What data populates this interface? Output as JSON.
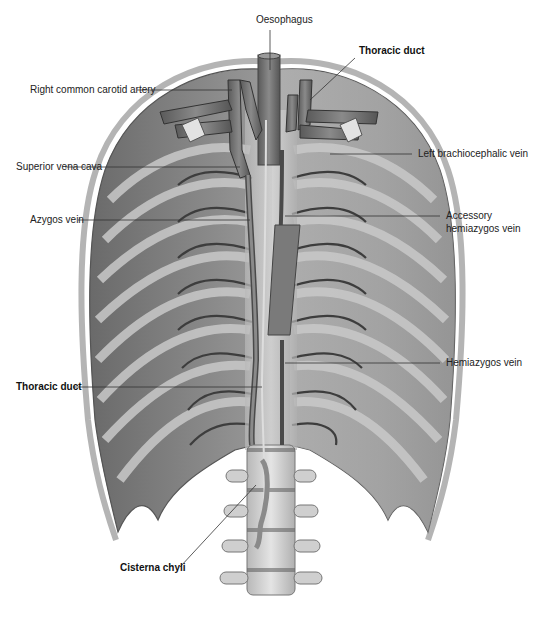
{
  "figure": {
    "style": "grayscale anatomical illustration",
    "colors": {
      "background": "#ffffff",
      "muscle": "#8c8c8c",
      "rib": "#bdbdbd",
      "vessel": "#6e6e6e",
      "vertebra": "#d6d6d6",
      "label_text": "#222222"
    }
  },
  "labels": {
    "oesophagus": "Oesophagus",
    "thoracic_duct_top": "Thoracic duct",
    "right_common_carotid": "Right common carotid artery",
    "left_brachiocephalic": "Left brachiocephalic vein",
    "superior_vena_cava": "Superior vena cava",
    "azygos": "Azygos vein",
    "accessory_hemiazygos_1": "Accessory",
    "accessory_hemiazygos_2": "hemiazygos vein",
    "hemiazygos": "Hemiazygos vein",
    "thoracic_duct_bottom": "Thoracic duct",
    "cisterna_chyli": "Cisterna chyli"
  }
}
